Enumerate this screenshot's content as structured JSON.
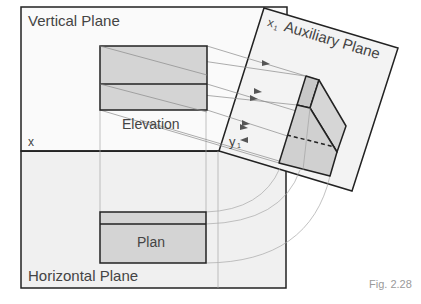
{
  "figure": {
    "caption": "Fig. 2.28",
    "labels": {
      "vertical_plane": "Vertical Plane",
      "horizontal_plane": "Horizontal Plane",
      "auxiliary_plane": "Auxiliary Plane",
      "elevation": "Elevation",
      "plan": "Plan",
      "x": "x",
      "x1": "x",
      "x1_sub": "1",
      "y1": "y",
      "y1_sub": "1"
    },
    "colors": {
      "plane_fill": "#f3f3f3",
      "view_fill": "#d4d4d4",
      "outline": "#222222",
      "projection_line": "#9a9a9a",
      "caption": "#9a9a9a"
    }
  }
}
